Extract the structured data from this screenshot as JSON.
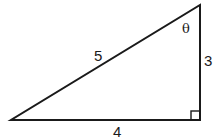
{
  "diagram": {
    "type": "right-triangle",
    "stroke_color": "#1a1a1a",
    "background": "#ffffff",
    "vertices": {
      "left": [
        11,
        120
      ],
      "right_angle": [
        200,
        120
      ],
      "top": [
        200,
        5
      ]
    },
    "labels": {
      "hypotenuse": "5",
      "vertical_leg": "3",
      "horizontal_leg": "4",
      "angle": "θ"
    },
    "right_angle_marker": true
  }
}
